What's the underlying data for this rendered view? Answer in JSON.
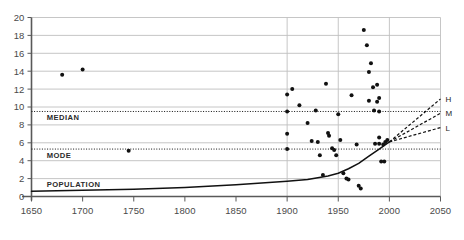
{
  "chart_data": {
    "type": "scatter",
    "title": "",
    "xlabel": "",
    "ylabel": "",
    "xlim": [
      1650,
      2050
    ],
    "ylim": [
      0,
      20
    ],
    "xticks": [
      1650,
      1700,
      1750,
      1800,
      1850,
      1900,
      1950,
      2000,
      2050
    ],
    "yticks": [
      0,
      2,
      4,
      6,
      8,
      10,
      12,
      14,
      16,
      18,
      20
    ],
    "grid": true,
    "legend_position": "none",
    "series": [
      {
        "name": "estimates",
        "type": "scatter",
        "marker": "filled-circle",
        "color": "#111111",
        "points": [
          [
            1680,
            13.6
          ],
          [
            1700,
            14.2
          ],
          [
            1745,
            5.1
          ],
          [
            1900,
            11.4
          ],
          [
            1900,
            9.5
          ],
          [
            1900,
            7.0
          ],
          [
            1900,
            5.3
          ],
          [
            1905,
            12.0
          ],
          [
            1912,
            10.2
          ],
          [
            1920,
            8.2
          ],
          [
            1924,
            6.2
          ],
          [
            1928,
            9.6
          ],
          [
            1930,
            6.1
          ],
          [
            1932,
            4.6
          ],
          [
            1935,
            2.4
          ],
          [
            1938,
            12.6
          ],
          [
            1940,
            7.1
          ],
          [
            1941,
            6.8
          ],
          [
            1944,
            5.4
          ],
          [
            1946,
            5.2
          ],
          [
            1948,
            4.6
          ],
          [
            1950,
            9.2
          ],
          [
            1952,
            6.3
          ],
          [
            1955,
            2.6
          ],
          [
            1958,
            2.0
          ],
          [
            1960,
            1.9
          ],
          [
            1963,
            11.3
          ],
          [
            1968,
            5.8
          ],
          [
            1970,
            1.2
          ],
          [
            1972,
            0.9
          ],
          [
            1975,
            18.6
          ],
          [
            1978,
            16.9
          ],
          [
            1980,
            13.9
          ],
          [
            1980,
            10.7
          ],
          [
            1982,
            14.9
          ],
          [
            1984,
            12.2
          ],
          [
            1985,
            9.6
          ],
          [
            1986,
            5.9
          ],
          [
            1988,
            12.5
          ],
          [
            1988,
            10.6
          ],
          [
            1990,
            11.0
          ],
          [
            1990,
            9.5
          ],
          [
            1990,
            6.6
          ],
          [
            1990,
            5.9
          ],
          [
            1992,
            3.9
          ],
          [
            1994,
            5.8
          ],
          [
            1995,
            3.9
          ],
          [
            1996,
            6.1
          ],
          [
            1998,
            6.3
          ]
        ]
      },
      {
        "name": "POPULATION",
        "type": "line",
        "style": "solid",
        "color": "#111111",
        "points": [
          [
            1650,
            0.6
          ],
          [
            1700,
            0.7
          ],
          [
            1750,
            0.8
          ],
          [
            1800,
            1.0
          ],
          [
            1850,
            1.3
          ],
          [
            1900,
            1.7
          ],
          [
            1920,
            1.9
          ],
          [
            1940,
            2.3
          ],
          [
            1950,
            2.6
          ],
          [
            1960,
            3.1
          ],
          [
            1970,
            3.7
          ],
          [
            1980,
            4.5
          ],
          [
            1990,
            5.3
          ],
          [
            2000,
            6.1
          ]
        ]
      },
      {
        "name": "H",
        "type": "line",
        "style": "dashed",
        "color": "#111111",
        "points": [
          [
            2000,
            6.1
          ],
          [
            2050,
            10.9
          ]
        ]
      },
      {
        "name": "M",
        "type": "line",
        "style": "dashed",
        "color": "#111111",
        "points": [
          [
            2000,
            6.1
          ],
          [
            2050,
            9.3
          ]
        ]
      },
      {
        "name": "L",
        "type": "line",
        "style": "dashed",
        "color": "#111111",
        "points": [
          [
            2000,
            6.1
          ],
          [
            2050,
            7.7
          ]
        ]
      },
      {
        "name": "MEDIAN",
        "type": "hline",
        "style": "dotted",
        "color": "#111111",
        "value": 9.5
      },
      {
        "name": "MODE",
        "type": "hline",
        "style": "dotted",
        "color": "#111111",
        "value": 5.3
      }
    ],
    "annotations": [
      {
        "text": "MEDIAN",
        "x": 1660,
        "y": 9.5,
        "placement": "below-right"
      },
      {
        "text": "MODE",
        "x": 1660,
        "y": 5.3,
        "placement": "below-right"
      },
      {
        "text": "POPULATION",
        "x": 1660,
        "y": 2.0,
        "placement": "below-right"
      },
      {
        "text": "H",
        "x": 2050,
        "y": 10.9,
        "placement": "right"
      },
      {
        "text": "M",
        "x": 2050,
        "y": 9.3,
        "placement": "right"
      },
      {
        "text": "L",
        "x": 2050,
        "y": 7.7,
        "placement": "right"
      }
    ],
    "colors": {
      "gridline": "#bfbfbf",
      "axis": "#595959",
      "marker": "#111111",
      "text": "#4a4a4a"
    }
  },
  "axis": {
    "x_labels": [
      "1650",
      "1700",
      "1750",
      "1800",
      "1850",
      "1900",
      "1950",
      "2000",
      "2050"
    ],
    "y_labels": [
      "0",
      "2",
      "4",
      "6",
      "8",
      "10",
      "12",
      "14",
      "16",
      "18",
      "20"
    ]
  },
  "bands": {
    "median_label": "MEDIAN",
    "mode_label": "MODE",
    "population_label": "POPULATION"
  },
  "projections": {
    "high_label": "H",
    "medium_label": "M",
    "low_label": "L"
  }
}
